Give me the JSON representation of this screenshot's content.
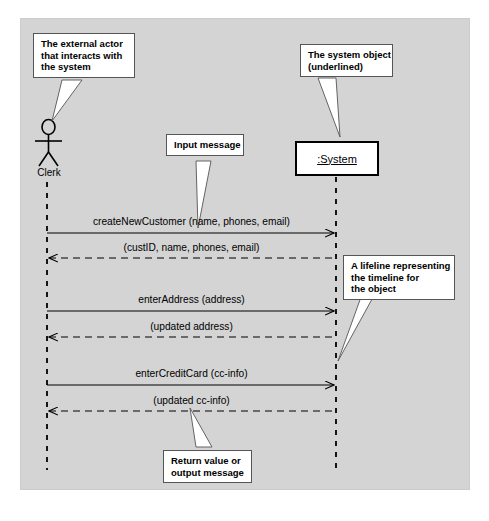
{
  "diagram": {
    "type": "uml-system-sequence-diagram",
    "background_color": "#d4d4d4",
    "page_color": "#ffffff"
  },
  "actor": {
    "name": "Clerk",
    "icon": "stick-figure-actor"
  },
  "object": {
    "name": ":System",
    "underlined": true
  },
  "callouts": [
    {
      "id": "actor",
      "lines": [
        "The external actor",
        "that interacts with",
        "the system"
      ]
    },
    {
      "id": "system",
      "lines": [
        "The system object",
        "(underlined)"
      ]
    },
    {
      "id": "input",
      "lines": [
        "Input message"
      ]
    },
    {
      "id": "lifeline",
      "lines": [
        "A lifeline representing",
        "the timeline for",
        "the object"
      ]
    },
    {
      "id": "return",
      "lines": [
        "Return value or",
        "output message"
      ]
    }
  ],
  "messages": [
    {
      "index": 0,
      "label": "createNewCustomer (name, phones, email)",
      "direction": "actor-to-system",
      "style": "solid"
    },
    {
      "index": 1,
      "label": "(custID, name, phones, email)",
      "direction": "system-to-actor",
      "style": "dashed"
    },
    {
      "index": 2,
      "label": "enterAddress (address)",
      "direction": "actor-to-system",
      "style": "solid"
    },
    {
      "index": 3,
      "label": "(updated address)",
      "direction": "system-to-actor",
      "style": "dashed"
    },
    {
      "index": 4,
      "label": "enterCreditCard (cc-info)",
      "direction": "actor-to-system",
      "style": "solid"
    },
    {
      "index": 5,
      "label": "(updated cc-info)",
      "direction": "system-to-actor",
      "style": "dashed"
    }
  ]
}
